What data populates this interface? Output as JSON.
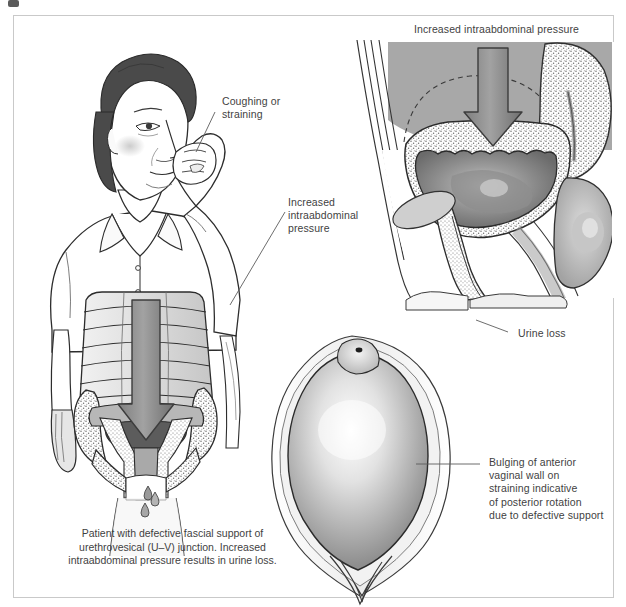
{
  "figure": {
    "type": "medical-illustration",
    "frame": {
      "border_color": "#c9c9c9",
      "background": "#ffffff"
    }
  },
  "labels": {
    "coughing_or_straining": "Coughing or\nstraining",
    "increased_intraabdominal_pressure_left": "Increased\nintraabdominal\npressure",
    "increased_intraabdominal_pressure_top": "Increased intraabdominal pressure",
    "urine_loss": "Urine loss",
    "bulging_anterior_vaginal_wall": "Bulging of anterior\nvaginal wall on\nstraining indicative\nof posterior rotation\ndue to defective support"
  },
  "caption": {
    "text": "Patient with defective fascial support of\nurethrovesical (U–V) junction. Increased\nintraabdominal pressure results in urine loss."
  },
  "panels": {
    "patient": {
      "name": "Patient coughing, frontal view with torso cutaway"
    },
    "sagittal": {
      "name": "Sagittal pelvic section showing bladder and urethra"
    },
    "perineum": {
      "name": "Perineal view showing bulging anterior vaginal wall"
    }
  },
  "colors": {
    "ink": "#3f3f3f",
    "outline": "#222222",
    "arrow_fill": "#8d8d8d",
    "arrow_stroke": "#3c3c3c",
    "soft_gray": "#bfbfbf",
    "mid_gray": "#9a9a9a",
    "dark_gray": "#6f6f6f",
    "bladder_dark": "#5c5c5c",
    "hair_dark": "#4a4a4a",
    "skin_light": "#fdfdfd",
    "frame_border": "#c9c9c9"
  },
  "icons": {
    "urine_drop": "drop-icon",
    "down_arrow": "down-arrow-icon"
  }
}
